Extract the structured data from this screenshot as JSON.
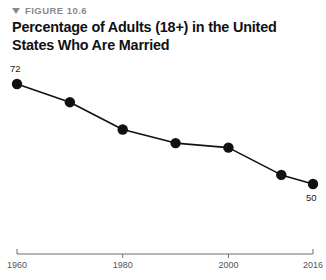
{
  "figure": {
    "kicker": "FIGURE 10.6",
    "kicker_icon": "triangle-down-icon",
    "title": "Percentage of Adults (18+) in the United States Who Are Married"
  },
  "chart_data": {
    "type": "line",
    "title": "Percentage of Adults (18+) in the United States Who Are Married",
    "xlabel": "",
    "ylabel": "",
    "x": [
      1960,
      1970,
      1980,
      1990,
      2000,
      2010,
      2016
    ],
    "values": [
      72,
      68,
      62,
      59,
      58,
      52,
      50
    ],
    "point_labels": {
      "first": "72",
      "last": "50"
    },
    "xticks": [
      1960,
      1980,
      2000,
      2016
    ],
    "xtick_labels": [
      "1960",
      "1980",
      "2000",
      "2016"
    ],
    "xlim": [
      1960,
      2016
    ],
    "ylim": [
      45,
      76
    ],
    "grid": false,
    "legend": null,
    "series_color": "#111111",
    "marker": "circle",
    "axis_color": "#6f6f6f"
  }
}
